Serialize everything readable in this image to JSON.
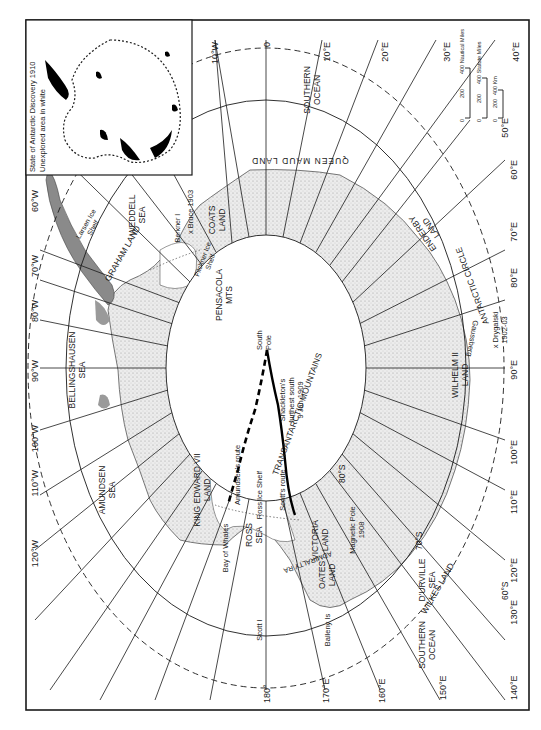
{
  "inset": {
    "title_line1": "State of Antarctic Discovery 1910",
    "title_line2": "Unexplored area in white"
  },
  "scale_bars": [
    {
      "label": "400 Nautical Miles",
      "ticks": [
        "0",
        "200",
        "400"
      ]
    },
    {
      "label": "400 Statute Miles",
      "ticks": [
        "0",
        "200",
        "400"
      ]
    },
    {
      "label": "400 Km",
      "ticks": [
        "0",
        "200",
        "400"
      ]
    }
  ],
  "scale_text": {
    "nautical": "Nautical Miles",
    "statute": "Statute Miles",
    "km": "Km",
    "t0": "0",
    "t200": "200",
    "t400": "400"
  },
  "meridians": {
    "m0": "0",
    "m10e": "10°E",
    "m20e": "20°E",
    "m30e": "30°E",
    "m40e": "40°E",
    "m50e": "50°E",
    "m60e": "60°E",
    "m70e": "70°E",
    "m80e": "80°E",
    "m90e": "90°E",
    "m100e": "100°E",
    "m110e": "110°E",
    "m120e": "120°E",
    "m130e": "130°E",
    "m140e": "140°E",
    "m150e": "150°E",
    "m160e": "160°E",
    "m170e": "170°E",
    "m180": "180°",
    "m10w": "10°W",
    "m60w": "60°W",
    "m70w": "70°W",
    "m80w": "80°W",
    "m90w": "90°W",
    "m100w": "100°W",
    "m110w": "110°W",
    "m120w": "120°W"
  },
  "parallels": {
    "p80": "80°S",
    "p70": "70°S",
    "p60": "60°S"
  },
  "regions": {
    "queen_maud": "QUEEN MAUD LAND",
    "enderby1": "ENDERBY",
    "enderby2": "LAND",
    "antarctic_circle": "ANTARCTIC CIRCLE",
    "wilhelm1": "WILHELM II",
    "wilhelm2": "LAND",
    "wilkes": "WILKES LAND",
    "durville1": "D'URVILLE",
    "durville2": "SEA",
    "southern_ocean_1a": "SOUTHERN",
    "southern_ocean_1b": "OCEAN",
    "southern_ocean_2a": "SOUTHERN",
    "southern_ocean_2b": "OCEAN",
    "oates1": "OATES",
    "oates2": "LAND",
    "victoria1": "VICTORIA",
    "victoria2": "LAND",
    "admiralty": "ADMIRALTY RA",
    "transantarctic": "TRANSANTARCTIC MOUNTAINS",
    "ross1": "ROSS",
    "ross2": "SEA",
    "ross_ice": "Ross Ice Shelf",
    "king_edward1": "KING EDWARD VII",
    "king_edward2": "LAND",
    "amundsen1": "AMUNDSEN",
    "amundsen2": "SEA",
    "bellingshausen1": "BELLINGSHAUSEN",
    "bellingshausen2": "SEA",
    "graham": "GRAHAM LAND",
    "larsen1": "Larsen Ice",
    "larsen2": "Shelf",
    "weddell1": "WEDDELL",
    "weddell2": "SEA",
    "berkner": "Berkner I",
    "filchner1": "Filchner Ice",
    "filchner2": "Shelf",
    "coats1": "COATS",
    "coats2": "LAND",
    "pensacola1": "PENSACOLA",
    "pensacola2": "MTS"
  },
  "places": {
    "south_pole1": "South",
    "south_pole2": "Pole",
    "shackleton1": "Shackleton's",
    "shackleton2": "furthest south",
    "shackleton3": "9 Jan 1909",
    "scott_route": "Scott's route",
    "amundsen_route": "Amundsen's route",
    "bay_of_whales": "Bay of Whales",
    "magnetic1": "Magnetic Pole",
    "magnetic2": "1908",
    "scott_i": "Scott I",
    "balleny": "Balleny Is",
    "bruce": "x Bruce 1903",
    "drygalski1": "x Drygalski",
    "drygalski2": "1902-03",
    "gaussberg": "Gaussberg"
  },
  "colors": {
    "ink": "#1a1a1a",
    "land": "#d9d9d9",
    "peninsula": "#8a8a8a",
    "paper": "#ffffff"
  }
}
